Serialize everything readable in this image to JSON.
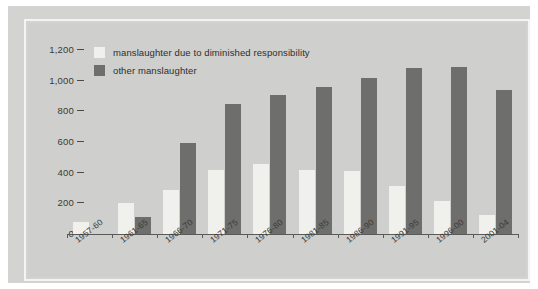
{
  "chart_data": {
    "type": "bar",
    "title": "",
    "subtitle": "",
    "xlabel": "",
    "ylabel": "",
    "grid": false,
    "legend_position": "top-left",
    "categories": [
      "1957-60",
      "1961-65",
      "1966-70",
      "1971-75",
      "1976-80",
      "1981-85",
      "1986-90",
      "1991-95",
      "1996-00",
      "2001-04"
    ],
    "ylim": [
      0,
      1200
    ],
    "yticks": [
      "0",
      "200",
      "400",
      "600",
      "800",
      "1,000",
      "1,200"
    ],
    "ytick_values": [
      0,
      200,
      400,
      600,
      800,
      1000,
      1200
    ],
    "series": [
      {
        "name": "manslaughter due to diminished responsibility",
        "color": "#f0f0ec",
        "values": [
          80,
          200,
          285,
          420,
          455,
          415,
          410,
          310,
          215,
          125
        ]
      },
      {
        "name": "other manslaughter",
        "color": "#6e6e6c",
        "values": [
          0,
          110,
          595,
          845,
          905,
          960,
          1020,
          1085,
          1090,
          940
        ]
      }
    ]
  },
  "legend": {
    "items": [
      {
        "label": "manslaughter due to diminished responsibility",
        "swatch": "light"
      },
      {
        "label": "other manslaughter",
        "swatch": "dark"
      }
    ]
  },
  "colors": {
    "page_background": "#ffffff",
    "frame": "#d3d3d1",
    "plot_background": "#cfcfcd",
    "inner_rule": "#f4f4f2",
    "axis": "#5a5a58",
    "light_bar": "#f0f0ec",
    "dark_bar": "#6e6e6c",
    "text": "#3a3a38"
  }
}
